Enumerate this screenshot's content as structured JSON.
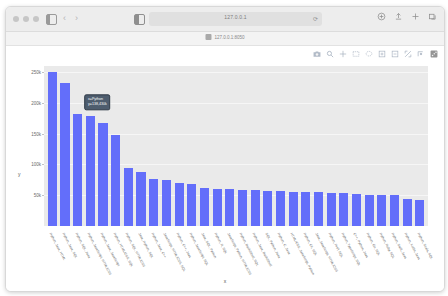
{
  "browser": {
    "traffic_lights": [
      "close",
      "minimize",
      "zoom"
    ],
    "sidebar_icon": "sidebar-icon",
    "back_label": "‹",
    "forward_label": "›",
    "reader_icon": "reader-view-icon",
    "url_text": "127.0.0.1",
    "reload_label": "⟳",
    "right_icons": [
      "share-icon",
      "download-icon",
      "new-tab-icon",
      "tab-overview-icon"
    ],
    "bookmark": {
      "icon": "bookmark-favicon",
      "label": "127.0.0.1:8050"
    }
  },
  "modebar": {
    "buttons": [
      "camera-download-icon",
      "zoom-select-icon",
      "pan-icon",
      "box-select-icon",
      "lasso-select-icon",
      "zoom-in-icon",
      "zoom-out-icon",
      "autoscale-icon",
      "reset-axes-icon",
      "plotly-logo-icon"
    ]
  },
  "tooltip": {
    "line1": "x=Python",
    "line2": "y=138,430k"
  },
  "chart_data": {
    "type": "bar",
    "title": "",
    "xlabel": "x",
    "ylabel": "y",
    "ylim": [
      0,
      260000
    ],
    "grid": true,
    "legend": "none",
    "bar_color": "#636efa",
    "plot_bgcolor": "#eaeaea",
    "yticks": [
      {
        "value": 250000,
        "label": "250k"
      },
      {
        "value": 200000,
        "label": "200k"
      },
      {
        "value": 150000,
        "label": "150k"
      },
      {
        "value": 100000,
        "label": "100k"
      },
      {
        "value": 50000,
        "label": "50k"
      }
    ],
    "categories": [
      "Python, Java, HTML",
      "Python, Java, SQL",
      "Python, SQL, Java",
      "Python, JavaScript, HTML/CSS",
      "Python, Java, JavaScript",
      "Python, HTML/CSS, SQL",
      "Python, SQL, HTML/CSS",
      "Java, Python, SQL",
      "Python, Java, C++",
      "JavaScript, HTML/CSS, SQL",
      "Python, C++, Java",
      "Python, JavaScript, SQL",
      "Java, SQL, Python",
      "Python, R, SQL",
      "JavaScript, Python, HTML/CSS",
      "Python, Bash/Shell, SQL",
      "Python, Java, Bash/Shell",
      "SQL, Python, Java",
      "Python, C, Java",
      "HTML/CSS, JavaScript, Python",
      "Python, C#, SQL",
      "Java, JavaScript, HTML/CSS",
      "Python, PHP, SQL",
      "Python, TypeScript, SQL",
      "C++, Python, Java",
      "Python, Go, SQL",
      "Python, Ruby, SQL",
      "Python, Swift, Java",
      "Python, Kotlin, Java",
      "Python, Scala, SQL"
    ],
    "values": [
      250000,
      232000,
      182000,
      178000,
      168000,
      148000,
      95000,
      88000,
      76000,
      74000,
      70000,
      68000,
      62000,
      60000,
      60000,
      59000,
      58000,
      57000,
      57000,
      56000,
      56000,
      55000,
      54000,
      53000,
      52000,
      51000,
      50000,
      50000,
      44000,
      43000
    ]
  }
}
